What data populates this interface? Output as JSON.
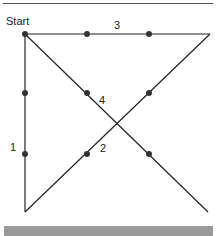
{
  "diagram": {
    "start_label": "Start",
    "line_labels": [
      "1",
      "2",
      "3",
      "4"
    ],
    "colors": {
      "line": "#222222",
      "dot": "#333333",
      "bar": "#9a9a9a"
    }
  }
}
